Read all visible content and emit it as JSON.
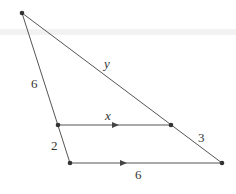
{
  "figure": {
    "points": [
      "apex",
      "left-mid",
      "right-mid",
      "base-left",
      "base-right"
    ],
    "labels": {
      "left_upper_side": "6",
      "left_lower_side": "2",
      "right_upper_side": "y",
      "right_lower_side": "3",
      "parallel_segment": "x",
      "base": "6"
    },
    "parallel_marks": true
  }
}
